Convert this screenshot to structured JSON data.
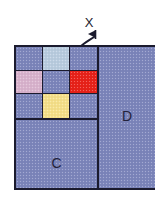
{
  "figure": {
    "background_color": "#ffffff",
    "border_color": "#1b1b2e",
    "base_fill": "#7c85bb"
  },
  "axis_marker": {
    "label": "X",
    "icon": "curved-arrow-right-icon",
    "color": "#1b1b2e"
  },
  "regions": [
    {
      "id": "D",
      "label": "D",
      "fill": "#7c85bb"
    },
    {
      "id": "C",
      "label": "C",
      "fill": "#7c85bb"
    }
  ],
  "grid": {
    "rows": 3,
    "cols": 3,
    "cells": [
      {
        "index": 0,
        "row": 1,
        "col": 1,
        "color": "#7c85bb",
        "name": "plain"
      },
      {
        "index": 1,
        "row": 1,
        "col": 2,
        "color": "#b9ccdf",
        "name": "light-blue"
      },
      {
        "index": 2,
        "row": 1,
        "col": 3,
        "color": "#7c85bb",
        "name": "plain"
      },
      {
        "index": 3,
        "row": 2,
        "col": 1,
        "color": "#d9b3cd",
        "name": "pink"
      },
      {
        "index": 4,
        "row": 2,
        "col": 2,
        "color": "#7c85bb",
        "name": "plain"
      },
      {
        "index": 5,
        "row": 2,
        "col": 3,
        "color": "#e8221a",
        "name": "red"
      },
      {
        "index": 6,
        "row": 3,
        "col": 1,
        "color": "#7c85bb",
        "name": "plain"
      },
      {
        "index": 7,
        "row": 3,
        "col": 2,
        "color": "#f5e08a",
        "name": "yellow"
      },
      {
        "index": 8,
        "row": 3,
        "col": 3,
        "color": "#7c85bb",
        "name": "plain"
      }
    ]
  }
}
